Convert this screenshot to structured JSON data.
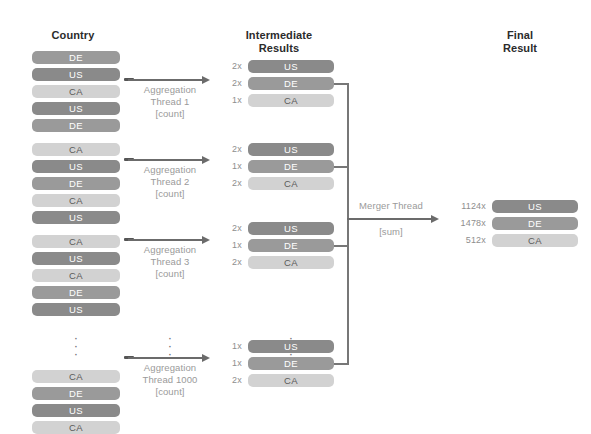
{
  "diagram": {
    "columns": {
      "country": "Country",
      "intermediate": "Intermediate\nResults",
      "intermediate_line1": "Intermediate",
      "intermediate_line2": "Results",
      "final_line1": "Final",
      "final_line2": "Result"
    },
    "ellipsis": "⋮"
  },
  "colors": {
    "de": "#9a9a9a",
    "us": "#8a8a8a",
    "ca": "#d2d2d2",
    "arrow": "#6b6b6b",
    "connector": "#777777",
    "heading_text": "#2b2b2b",
    "label_text": "#9a9a9a",
    "count_text": "#8e8e8e",
    "background": "#ffffff"
  },
  "country_blocks": [
    {
      "rows": [
        "DE",
        "US",
        "CA",
        "US",
        "DE"
      ]
    },
    {
      "rows": [
        "CA",
        "US",
        "DE",
        "CA",
        "US"
      ]
    },
    {
      "rows": [
        "CA",
        "US",
        "CA",
        "DE",
        "US"
      ]
    },
    {
      "rows": [
        "CA",
        "DE",
        "US",
        "CA"
      ]
    }
  ],
  "threads": [
    {
      "line1": "Aggregation",
      "line2": "Thread 1",
      "line3": "[count]"
    },
    {
      "line1": "Aggregation",
      "line2": "Thread 2",
      "line3": "[count]"
    },
    {
      "line1": "Aggregation",
      "line2": "Thread 3",
      "line3": "[count]"
    },
    {
      "line1": "Aggregation",
      "line2": "Thread 1000",
      "line3": "[count]"
    }
  ],
  "intermediate_blocks": [
    {
      "rows": [
        {
          "count": "2x",
          "label": "US"
        },
        {
          "count": "2x",
          "label": "DE"
        },
        {
          "count": "1x",
          "label": "CA"
        }
      ]
    },
    {
      "rows": [
        {
          "count": "2x",
          "label": "US"
        },
        {
          "count": "1x",
          "label": "DE"
        },
        {
          "count": "2x",
          "label": "CA"
        }
      ]
    },
    {
      "rows": [
        {
          "count": "2x",
          "label": "US"
        },
        {
          "count": "1x",
          "label": "DE"
        },
        {
          "count": "2x",
          "label": "CA"
        }
      ]
    },
    {
      "rows": [
        {
          "count": "1x",
          "label": "US"
        },
        {
          "count": "1x",
          "label": "DE"
        },
        {
          "count": "2x",
          "label": "CA"
        }
      ]
    }
  ],
  "merger": {
    "line1": "Merger Thread",
    "line2": "[sum]"
  },
  "final_result": {
    "rows": [
      {
        "count": "1124x",
        "label": "US"
      },
      {
        "count": "1478x",
        "label": "DE"
      },
      {
        "count": "512x",
        "label": "CA"
      }
    ]
  }
}
